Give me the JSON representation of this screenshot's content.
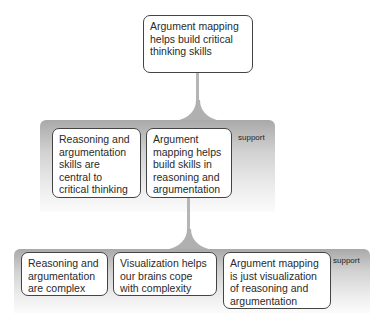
{
  "diagram": {
    "conclusion": {
      "text": "Argument mapping helps build critical thinking skills"
    },
    "level1": {
      "relation_label": "support",
      "premises": [
        {
          "text": "Reasoning and argumentation skills are central to critical thinking"
        },
        {
          "text": "Argument mapping helps build skills in reasoning and argumentation"
        }
      ]
    },
    "level2": {
      "relation_label": "support",
      "parent_premise_index": 1,
      "premises": [
        {
          "text": "Reasoning and argumentation are complex"
        },
        {
          "text": "Visualization helps our brains cope with complexity"
        },
        {
          "text": "Argument mapping is just visualization of reasoning and argumentation"
        }
      ]
    },
    "colors": {
      "box_border": "#444444",
      "band_top": "#a9a9a9",
      "band_bottom": "#fbfbfb",
      "connector": "#b5b5b5"
    }
  }
}
